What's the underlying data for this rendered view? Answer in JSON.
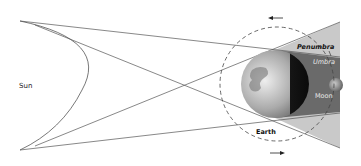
{
  "diagram": {
    "type": "lunar-eclipse-geometry",
    "labels": {
      "sun": "Sun",
      "penumbra": "Penumbra",
      "umbra": "Umbra",
      "moon": "Moon",
      "earth": "Earth"
    },
    "colors": {
      "lines": "#555555",
      "penumbra": "#c9c9c9",
      "umbra": "#6a6a6a",
      "orbit": "#444444"
    },
    "orbit_arrows": [
      "counterclockwise-top",
      "clockwise-bottom"
    ]
  }
}
